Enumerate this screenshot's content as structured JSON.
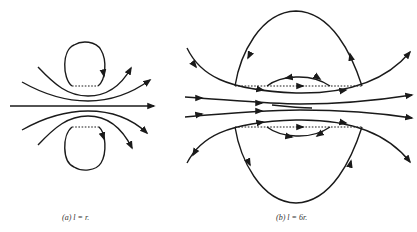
{
  "figure": {
    "panels": [
      {
        "id": "a",
        "caption_label": "(a)",
        "caption_text": "l = r.",
        "description": "Streamlines around two small closed loops (vortex ring cross-section) with separation l equal to radius r"
      },
      {
        "id": "b",
        "caption_label": "(b)",
        "caption_text": "l = 6r.",
        "description": "Streamlines with large dome-shaped closed regions above and below, each containing a smaller lens-shaped recirculation cell"
      }
    ],
    "colors": {
      "line": "#1a1a1a",
      "background": "#ffffff"
    }
  }
}
